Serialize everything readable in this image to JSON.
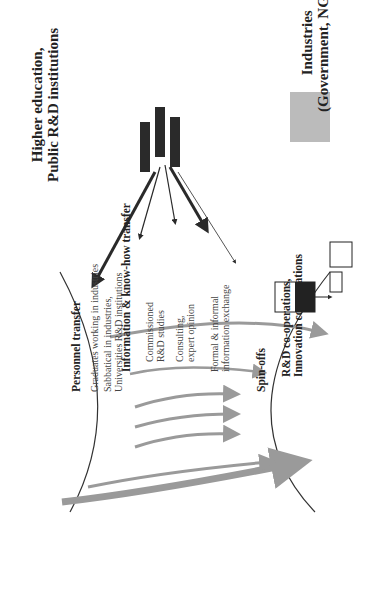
{
  "diagram": {
    "type": "knowledge-transfer-flow",
    "orientation": "rotated-90-ccw",
    "left_entity": {
      "line1": "Higher education,",
      "line2": "Public R&D institutions"
    },
    "right_entity": {
      "line1": "Industries",
      "line2": "(Government, NGOs)"
    },
    "sections": [
      {
        "title": "Personnel transfer",
        "items": [
          "Graduates working in industries",
          "Sabbatical in industries,",
          "Universities R&D institutions"
        ]
      },
      {
        "title": "Information & know-how transfer",
        "items": [
          "Commissioned",
          "R&D studies",
          "Consulting,",
          "expert opinion",
          "Formal & informal",
          "information exchange"
        ]
      },
      {
        "title": "Spin-offs",
        "items": []
      },
      {
        "title": "R&D co-operations,",
        "subtitle": "Innovation co-operations",
        "items": []
      }
    ],
    "icons": [
      "people-group-icon",
      "books-icon",
      "head-icon",
      "person-icon",
      "factory-icon",
      "phone-icon",
      "computer-icon",
      "meeting-photo-icon"
    ],
    "colors": {
      "arrow_gray": "#9a9a9a",
      "dark": "#2a2a2a",
      "line": "#333333"
    }
  }
}
